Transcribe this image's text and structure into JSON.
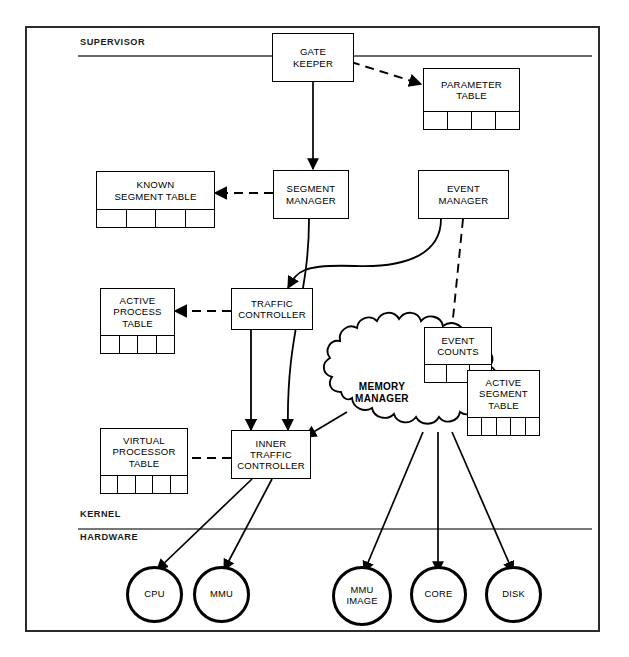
{
  "diagram": {
    "layers": [
      {
        "id": "supervisor",
        "label": "SUPERVISOR"
      },
      {
        "id": "kernel",
        "label": "KERNEL"
      },
      {
        "id": "hardware",
        "label": "HARDWARE"
      }
    ],
    "modules": [
      {
        "id": "gate-keeper",
        "label": "GATE\nKEEPER",
        "cells": 0
      },
      {
        "id": "parameter-table",
        "label": "PARAMETER\nTABLE",
        "cells": 4
      },
      {
        "id": "known-segment-table",
        "label": "KNOWN\nSEGMENT TABLE",
        "cells": 4
      },
      {
        "id": "segment-manager",
        "label": "SEGMENT\nMANAGER",
        "cells": 0
      },
      {
        "id": "event-manager",
        "label": "EVENT\nMANAGER",
        "cells": 0
      },
      {
        "id": "active-process-table",
        "label": "ACTIVE\nPROCESS\nTABLE",
        "cells": 4
      },
      {
        "id": "traffic-controller",
        "label": "TRAFFIC\nCONTROLLER",
        "cells": 0
      },
      {
        "id": "event-counts",
        "label": "EVENT\nCOUNTS",
        "cells": 3
      },
      {
        "id": "active-segment-table",
        "label": "ACTIVE\nSEGMENT\nTABLE",
        "cells": 5
      },
      {
        "id": "virtual-processor-table",
        "label": "VIRTUAL\nPROCESSOR\nTABLE",
        "cells": 5
      },
      {
        "id": "inner-traffic-controller",
        "label": "INNER\nTRAFFIC\nCONTROLLER",
        "cells": 0
      },
      {
        "id": "memory-manager",
        "label": "MEMORY\nMANAGER",
        "cells": 0
      }
    ],
    "hardware_units": [
      {
        "id": "cpu",
        "label": "CPU"
      },
      {
        "id": "mmu",
        "label": "MMU"
      },
      {
        "id": "mmu-image",
        "label": "MMU\nIMAGE"
      },
      {
        "id": "core",
        "label": "CORE"
      },
      {
        "id": "disk",
        "label": "DISK"
      }
    ],
    "colors": {
      "line": "#000000",
      "frame": "#2b2b2b",
      "background": "#ffffff"
    }
  }
}
